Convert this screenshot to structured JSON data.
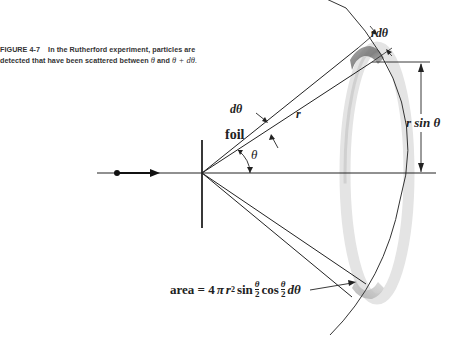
{
  "caption": {
    "figure_number": "FIGURE 4-7",
    "text_line1": "In the Rutherford experiment, particles are",
    "text_line2": "detected that have been scattered between",
    "theta": "θ",
    "and": "and",
    "theta_plus_dtheta": "θ + dθ."
  },
  "labels": {
    "foil": "foil",
    "theta": "θ",
    "dtheta": "dθ",
    "r": "r",
    "r_dtheta": "rdθ",
    "r_sin_theta": "r sin θ",
    "area": {
      "prefix": "area = 4",
      "pi": "π",
      "r": "r",
      "exp": "2",
      "sin": "sin",
      "cos": "cos",
      "frac_num": "θ",
      "frac_den": "2",
      "dtheta": "dθ"
    }
  },
  "diagram": {
    "colors": {
      "line": "#222222",
      "ring_light": "#e6e6e6",
      "ring_dark": "#8a8a8a"
    },
    "origin": [
      202,
      173
    ],
    "incident_beam": {
      "from": [
        97,
        173
      ],
      "dot": [
        117,
        173
      ],
      "arrow_tip": [
        160,
        173
      ]
    }
  }
}
